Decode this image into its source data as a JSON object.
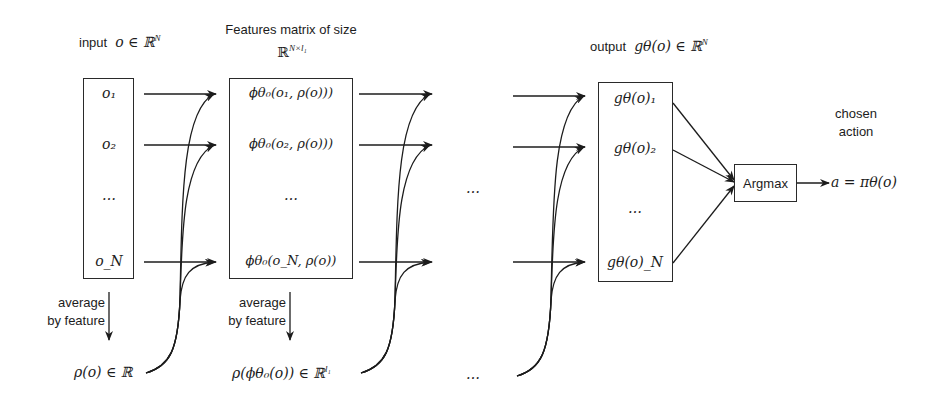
{
  "diagram": {
    "input": {
      "label_text": "input",
      "label_math": "o ∈ ℝ",
      "label_sup": "N",
      "items": [
        "o₁",
        "o₂",
        "…",
        "o_N"
      ]
    },
    "features": {
      "title_line1": "Features matrix of size",
      "title_line2_math": "ℝ",
      "title_line2_sup": "N×l₁",
      "items": [
        "ϕθ₀(o₁, ρ(o)))",
        "ϕθ₀(o₂, ρ(o)))",
        "…",
        "ϕθ₀(o_N, ρ(o))"
      ]
    },
    "average_labels": [
      {
        "line1": "average",
        "line2": "by feature"
      },
      {
        "line1": "average",
        "line2": "by feature"
      }
    ],
    "pooled": [
      {
        "math": "ρ(o) ∈ ℝ"
      },
      {
        "math": "ρ(ϕθ₀(o)) ∈ ℝ",
        "sup": "l₁"
      }
    ],
    "middle_ellipsis": [
      "…",
      "…"
    ],
    "output": {
      "label_text": "output",
      "label_math": "gθ(o) ∈ ℝ",
      "label_sup": "N",
      "items": [
        "gθ(o)₁",
        "gθ(o)₂",
        "…",
        "gθ(o)_N"
      ]
    },
    "argmax": {
      "label": "Argmax"
    },
    "action": {
      "label_line1": "chosen",
      "label_line2": "action",
      "math": "a = πθ(o)"
    },
    "colors": {
      "stroke": "#1c1c1c",
      "background": "#ffffff"
    }
  }
}
